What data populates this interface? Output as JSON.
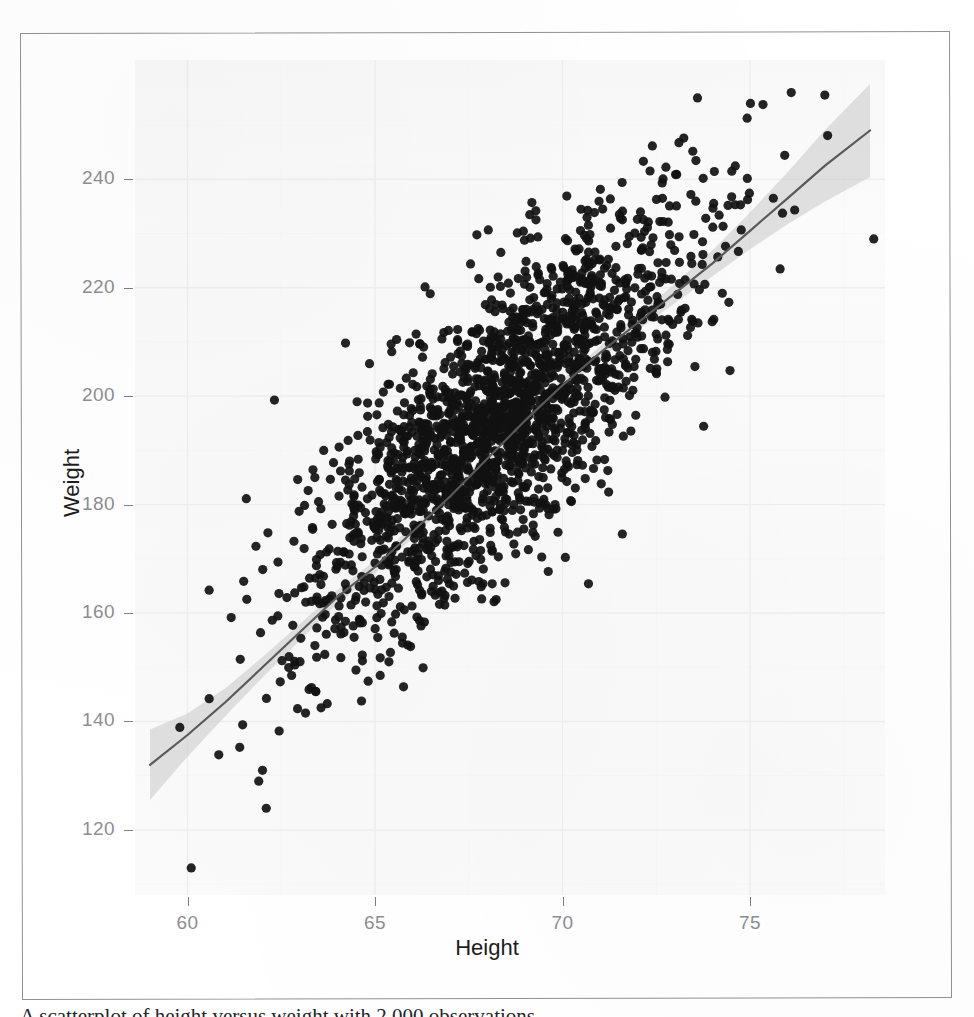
{
  "figure": {
    "kind": "scanned-figure",
    "frame_color": "#8f9196",
    "page_background": "#ffffff"
  },
  "chart_data": {
    "type": "scatter",
    "title": "",
    "subtitle": "",
    "xlabel": "Height",
    "ylabel": "Weight",
    "xlim": [
      58.6,
      78.6
    ],
    "ylim": [
      108,
      262
    ],
    "xticks": [
      60,
      65,
      70,
      75
    ],
    "yticks": [
      120,
      140,
      160,
      180,
      200,
      220,
      240
    ],
    "xtick_labels": [
      "60",
      "65",
      "70",
      "75"
    ],
    "ytick_labels": [
      "120",
      "140",
      "160",
      "180",
      "200",
      "220",
      "240"
    ],
    "grid": true,
    "grid_color": "#eeeeee",
    "panel_background": "#fbfbfb",
    "legend": null,
    "legend_position": "none",
    "n_observations": 2000,
    "point_color": "#111111",
    "point_radius": 4.6,
    "point_opacity": 0.92,
    "smooth": {
      "type": "loess",
      "line_color": "#595959",
      "line_width": 2.2,
      "ribbon_color": "#c9c9c9",
      "ribbon_opacity": 0.55,
      "fit_x": [
        59.0,
        60.0,
        61.0,
        62.0,
        63.0,
        64.0,
        65.0,
        66.0,
        67.0,
        68.0,
        69.0,
        70.0,
        71.0,
        72.0,
        73.0,
        74.0,
        75.0,
        76.0,
        77.0,
        78.2
      ],
      "fit_y": [
        132.0,
        137.5,
        143.5,
        150.0,
        156.5,
        163.0,
        168.5,
        175.0,
        181.5,
        188.5,
        195.5,
        202.0,
        208.0,
        213.5,
        219.0,
        224.5,
        230.5,
        236.5,
        242.5,
        249.0
      ],
      "ci_halfwidth": [
        6.5,
        4.0,
        2.6,
        1.9,
        1.5,
        1.3,
        1.2,
        1.1,
        1.0,
        1.0,
        1.0,
        1.1,
        1.2,
        1.4,
        1.8,
        2.4,
        3.4,
        4.8,
        6.6,
        8.6
      ]
    },
    "scatter_model": {
      "note": "point cloud regenerated from the distribution read off the figure",
      "x_mean": 68.3,
      "x_sd": 2.55,
      "x_min": 59.6,
      "x_max": 78.4,
      "slope": 5.95,
      "intercept": -211.0,
      "residual_sd": 12.2,
      "y_min": 112,
      "y_max": 258
    },
    "annotated_outliers": [
      {
        "x": 60.1,
        "y": 113,
        "note": "isolated low-left point"
      },
      {
        "x": 73.6,
        "y": 255,
        "note": "high point upper area"
      },
      {
        "x": 76.1,
        "y": 256,
        "note": "high point upper right"
      },
      {
        "x": 78.3,
        "y": 229,
        "note": "far right point"
      },
      {
        "x": 62.1,
        "y": 124,
        "note": "low point"
      },
      {
        "x": 62.0,
        "y": 131,
        "note": "low point"
      },
      {
        "x": 61.9,
        "y": 129,
        "note": "low point"
      }
    ]
  },
  "axis": {
    "x_title": "Height",
    "y_title": "Weight",
    "tick_label_color": "#8c8e93",
    "axis_title_color": "#1c1c1c"
  },
  "caption": {
    "text": "A scatterplot of height versus weight with 2,000 observations",
    "visibility": "clipped at bottom edge of screenshot"
  }
}
